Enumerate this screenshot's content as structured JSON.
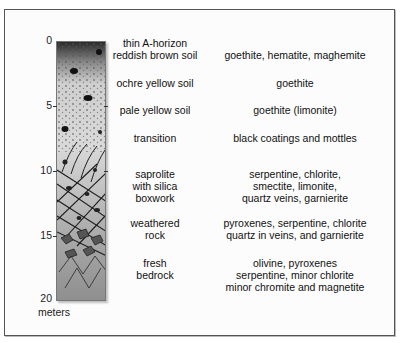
{
  "diagram": {
    "title": "",
    "depth_axis": {
      "unit_label": "meters",
      "ticks": [
        {
          "label": "0",
          "y": 41
        },
        {
          "label": "5",
          "y": 106
        },
        {
          "label": "10",
          "y": 171
        },
        {
          "label": "15",
          "y": 236
        },
        {
          "label": "20",
          "y": 298
        }
      ]
    },
    "horizons": [
      {
        "name": "thin A-horizon\nreddish brown soil",
        "lines": [
          "thin A-horizon",
          "reddish brown soil"
        ],
        "minerals": [
          "goethite, hematite, maghemite"
        ]
      },
      {
        "name": "ochre yellow soil",
        "lines": [
          "ochre yellow soil"
        ],
        "minerals": [
          "goethite"
        ]
      },
      {
        "name": "pale yellow soil",
        "lines": [
          "pale yellow soil"
        ],
        "minerals": [
          "goethite (limonite)"
        ]
      },
      {
        "name": "transition",
        "lines": [
          "transition"
        ],
        "minerals": [
          "black coatings and mottles"
        ]
      },
      {
        "name": "saprolite with silica boxwork",
        "lines": [
          "saprolite",
          "with silica",
          "boxwork"
        ],
        "minerals": [
          "serpentine, chlorite,",
          "smectite, limonite,",
          "quartz veins, garnierite"
        ]
      },
      {
        "name": "weathered rock",
        "lines": [
          "weathered",
          "rock"
        ],
        "minerals": [
          "pyroxenes, serpentine, chlorite",
          "quartz in veins, and garnierite"
        ]
      },
      {
        "name": "fresh bedrock",
        "lines": [
          "fresh",
          "bedrock"
        ],
        "minerals": [
          "olivine, pyroxenes",
          "serpentine, minor chlorite",
          "minor chromite and magnetite"
        ]
      }
    ]
  }
}
